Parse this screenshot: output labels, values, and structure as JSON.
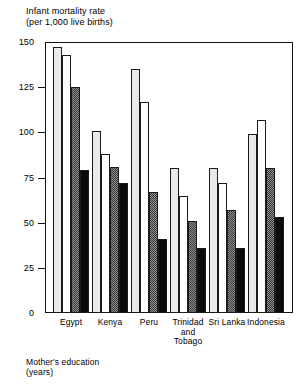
{
  "chart_data": {
    "type": "bar",
    "title": "Infant mortality rate\n(per 1,000 live births)",
    "ylabel": "Infant mortality rate (per 1,000 live births)",
    "xlabel": "Mother's education\n(years)",
    "ylim": [
      0,
      150
    ],
    "yticks": [
      0,
      25,
      50,
      75,
      100,
      125,
      150
    ],
    "ytick_labels": [
      "0",
      "25",
      "50",
      "75",
      "100",
      "125",
      "150"
    ],
    "grid": false,
    "legend": "none",
    "categories": [
      "Egypt",
      "Kenya",
      "Peru",
      "Trinidad\nand\nTobago",
      "Sri Lanka",
      "Indonesia"
    ],
    "series": [
      {
        "name": "0 years",
        "fill": "light-stipple",
        "values": [
          147,
          101,
          135,
          80,
          80,
          99
        ]
      },
      {
        "name": "1-3 years",
        "fill": "white-outline",
        "values": [
          143,
          88,
          117,
          65,
          72,
          107
        ]
      },
      {
        "name": "4-6 years",
        "fill": "gray-checker",
        "values": [
          125,
          81,
          67,
          51,
          57,
          80
        ]
      },
      {
        "name": "7+ years",
        "fill": "solid-black",
        "values": [
          79,
          72,
          41,
          36,
          36,
          53
        ]
      }
    ]
  },
  "footnote": "Mother's  education\n(years)"
}
